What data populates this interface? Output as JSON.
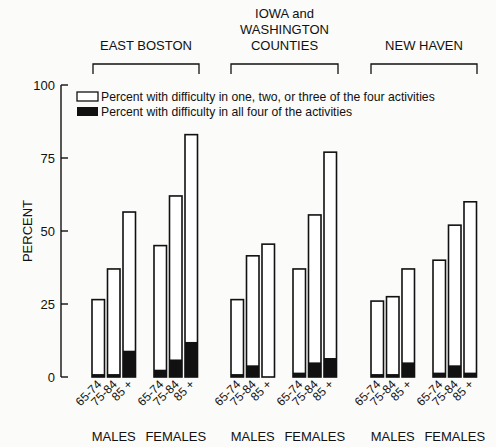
{
  "chart_data": {
    "type": "bar",
    "stacked": true,
    "title": "",
    "xlabel": "",
    "ylabel": "PERCENT",
    "ylim": [
      0,
      100
    ],
    "yticks": [
      0,
      25,
      50,
      75,
      100
    ],
    "grid": false,
    "legend": {
      "placement": "top",
      "entries": [
        {
          "name": "Percent with difficulty in one, two, or three of the four activities",
          "fill": "#ffffff"
        },
        {
          "name": "Percent with difficulty in all four of the activities",
          "fill": "#000000"
        }
      ]
    },
    "age_groups": [
      "65-74",
      "75-84",
      "85+"
    ],
    "panels": [
      {
        "name": "EAST BOSTON",
        "name_lines": [
          "EAST BOSTON"
        ],
        "sexes": [
          {
            "label": "MALES",
            "total": [
              26.5,
              37,
              56.5
            ],
            "all_four": [
              1,
              1,
              9
            ]
          },
          {
            "label": "FEMALES",
            "total": [
              45,
              62,
              83
            ],
            "all_four": [
              2.5,
              6,
              12
            ]
          }
        ]
      },
      {
        "name": "IOWA and WASHINGTON COUNTIES",
        "name_lines": [
          "IOWA and",
          "WASHINGTON",
          "COUNTIES"
        ],
        "sexes": [
          {
            "label": "MALES",
            "total": [
              26.5,
              41.5,
              45.5
            ],
            "all_four": [
              1,
              4,
              0
            ]
          },
          {
            "label": "FEMALES",
            "total": [
              37,
              55.5,
              77
            ],
            "all_four": [
              1.5,
              5,
              6.5
            ]
          }
        ]
      },
      {
        "name": "NEW HAVEN",
        "name_lines": [
          "NEW HAVEN"
        ],
        "sexes": [
          {
            "label": "MALES",
            "total": [
              26,
              27.5,
              37
            ],
            "all_four": [
              1,
              1,
              5
            ]
          },
          {
            "label": "FEMALES",
            "total": [
              40,
              52,
              60
            ],
            "all_four": [
              1.5,
              4,
              1.5
            ]
          }
        ]
      }
    ]
  }
}
